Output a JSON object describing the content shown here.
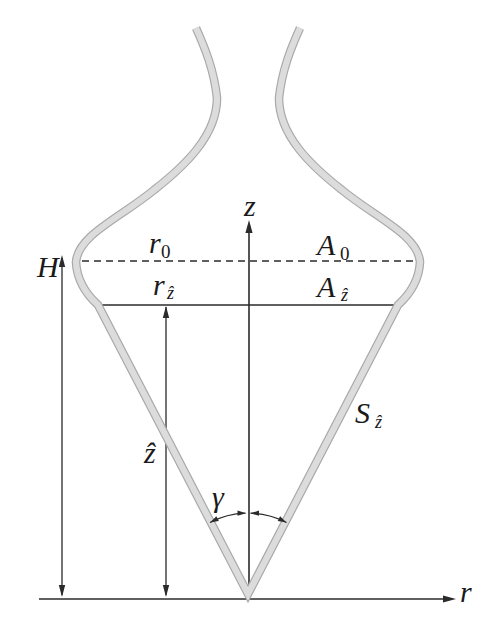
{
  "labels": {
    "z_axis": "z",
    "r_axis": "r",
    "height": "H",
    "r0_base": "r",
    "r0_sub": "0",
    "a0_base": "A",
    "a0_sub": "0",
    "rz_base": "r",
    "rz_sub": "ẑ",
    "az_base": "A",
    "az_sub": "ẑ",
    "z_hat": "ẑ",
    "gamma": "γ",
    "s_base": "S",
    "s_sub": "ẑ"
  },
  "colors": {
    "wall_fill": "#dcdcdc",
    "wall_edge": "#a9a9a9",
    "line": "#2b2b2b",
    "text": "#1a1a1a",
    "background": "#ffffff"
  }
}
